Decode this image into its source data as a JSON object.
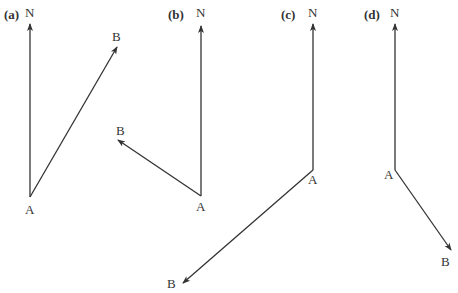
{
  "panels": [
    {
      "id": "a",
      "label": "(a)",
      "north": "N",
      "origin": "A",
      "target": "B",
      "bearing": "north-east (~30°)"
    },
    {
      "id": "b",
      "label": "(b)",
      "north": "N",
      "origin": "A",
      "target": "B",
      "bearing": "north-west (~304°)"
    },
    {
      "id": "c",
      "label": "(c)",
      "north": "N",
      "origin": "A",
      "target": "B",
      "bearing": "south-west (~229°)"
    },
    {
      "id": "d",
      "label": "(d)",
      "north": "N",
      "origin": "A",
      "target": "B",
      "bearing": "south-east (~145°)"
    }
  ],
  "colors": {
    "ink": "#333333",
    "background": "#ffffff"
  }
}
